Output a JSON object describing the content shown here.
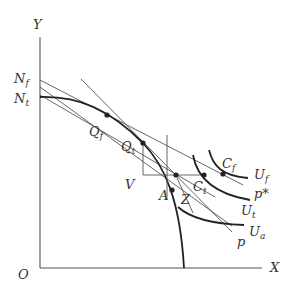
{
  "diagram": {
    "axes": {
      "y_label": "Y",
      "x_label": "X",
      "origin_label": "O"
    },
    "intercepts": {
      "n_f": {
        "base": "N",
        "sub": "f"
      },
      "n_t": {
        "base": "N",
        "sub": "t"
      }
    },
    "points": {
      "q_f": {
        "base": "Q",
        "sub": "f"
      },
      "q_t": {
        "base": "Q",
        "sub": "t"
      },
      "c_f": {
        "base": "C",
        "sub": "f"
      },
      "c_t": {
        "base": "C",
        "sub": "t"
      },
      "a": {
        "base": "A"
      },
      "z": {
        "base": "Z"
      },
      "v": {
        "base": "V"
      }
    },
    "curves": {
      "u_f": {
        "base": "U",
        "sub": "f"
      },
      "u_t": {
        "base": "U",
        "sub": "t"
      },
      "u_a": {
        "base": "U",
        "sub": "a"
      }
    },
    "price_lines": {
      "p_star": "p*",
      "p": "p"
    },
    "colors": {
      "line": "#555555",
      "curve": "#222222",
      "text": "#333333",
      "background": "#ffffff"
    }
  }
}
